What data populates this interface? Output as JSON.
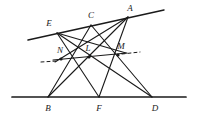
{
  "figure": {
    "kind": "geometry-diagram",
    "background_color": "#ffffff",
    "stroke_color": "#1a1a1a",
    "label_color": "#1a1a1a"
  },
  "points": [
    {
      "id": "E",
      "label": "E",
      "x": 57,
      "y": 33,
      "label_x": 49,
      "label_y": 23,
      "on": "upper-line"
    },
    {
      "id": "C",
      "label": "C",
      "x": 91,
      "y": 25,
      "label_x": 91,
      "label_y": 15,
      "on": "upper-line"
    },
    {
      "id": "A",
      "label": "A",
      "x": 128,
      "y": 17,
      "label_x": 130,
      "label_y": 8,
      "on": "upper-line"
    },
    {
      "id": "B",
      "label": "B",
      "x": 48,
      "y": 97,
      "label_x": 48,
      "label_y": 108,
      "on": "lower-line"
    },
    {
      "id": "F",
      "label": "F",
      "x": 99,
      "y": 97,
      "label_x": 99,
      "label_y": 108,
      "on": "lower-line"
    },
    {
      "id": "D",
      "label": "D",
      "x": 152,
      "y": 97,
      "label_x": 155,
      "label_y": 108,
      "on": "lower-line"
    },
    {
      "id": "N",
      "label": "N",
      "x": 61,
      "y": 59,
      "label_x": 60,
      "label_y": 50,
      "on": "cross-line"
    },
    {
      "id": "L",
      "label": "L",
      "x": 89,
      "y": 57,
      "label_x": 88,
      "label_y": 48,
      "on": "cross-line"
    },
    {
      "id": "M",
      "label": "M",
      "x": 118,
      "y": 55,
      "label_x": 121,
      "label_y": 46,
      "on": "cross-line"
    }
  ],
  "lines": [
    {
      "name": "upper-line",
      "x1": 28,
      "y1": 40,
      "x2": 164,
      "y2": 10,
      "width": 1.5
    },
    {
      "name": "lower-line",
      "x1": 12,
      "y1": 97,
      "x2": 186,
      "y2": 97,
      "width": 1.7
    },
    {
      "name": "segment-E-F",
      "x1": 57,
      "y1": 33,
      "x2": 99,
      "y2": 97,
      "width": 1.1
    },
    {
      "name": "segment-E-D",
      "x1": 57,
      "y1": 33,
      "x2": 152,
      "y2": 97,
      "width": 1.1
    },
    {
      "name": "segment-C-B",
      "x1": 91,
      "y1": 25,
      "x2": 48,
      "y2": 97,
      "width": 1.1
    },
    {
      "name": "segment-C-D",
      "x1": 91,
      "y1": 25,
      "x2": 152,
      "y2": 97,
      "width": 1.1
    },
    {
      "name": "segment-A-B",
      "x1": 128,
      "y1": 17,
      "x2": 48,
      "y2": 97,
      "width": 1.1
    },
    {
      "name": "segment-A-F",
      "x1": 128,
      "y1": 17,
      "x2": 99,
      "y2": 97,
      "width": 1.1
    },
    {
      "name": "segment-E-M",
      "x1": 57,
      "y1": 33,
      "x2": 126,
      "y2": 53,
      "width": 1.1
    },
    {
      "name": "segment-A-N",
      "x1": 128,
      "y1": 17,
      "x2": 55,
      "y2": 62,
      "width": 1.1
    }
  ],
  "cross_line": {
    "name": "line-N-L-M",
    "x1": 53,
    "y1": 60,
    "x2": 127,
    "y2": 53,
    "width": 1.2
  },
  "dashes": [
    {
      "name": "dash-left-of-N",
      "x1": 41,
      "y1": 62,
      "x2": 57,
      "y2": 61
    },
    {
      "name": "dash-right-of-M",
      "x1": 122,
      "y1": 54,
      "x2": 140,
      "y2": 52
    }
  ],
  "vertex_dots": [
    {
      "id": "N",
      "x": 61,
      "y": 59,
      "r": 1.6
    },
    {
      "id": "L",
      "x": 89,
      "y": 57,
      "r": 1.6
    },
    {
      "id": "M",
      "x": 118,
      "y": 55,
      "r": 1.6
    }
  ]
}
